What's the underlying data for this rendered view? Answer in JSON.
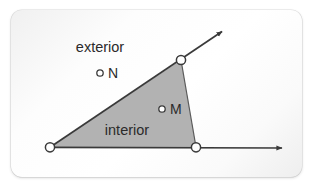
{
  "figure": {
    "type": "geometry-diagram",
    "canvas": {
      "width": 315,
      "height": 188
    },
    "card": {
      "x": 11,
      "y": 10,
      "width": 291,
      "height": 167,
      "corner_radius": 11,
      "background_color": "#fbfbfb",
      "shadow_color": "rgba(0,0,0,0.16)"
    },
    "colors": {
      "stroke": "#3a3a3a",
      "interior_fill": "#b2b2b2",
      "vertex_fill": "#ffffff",
      "text": "#2b2b2b"
    },
    "geometry": {
      "vertex": {
        "name": "angle-vertex",
        "x": 50,
        "y": 147,
        "radius": 4.6
      },
      "ray_horizontal": {
        "name": "ray-horizontal",
        "from": {
          "x": 50,
          "y": 147
        },
        "to": {
          "x": 285,
          "y": 148
        },
        "arrow": true
      },
      "ray_diagonal": {
        "name": "ray-diagonal",
        "from": {
          "x": 50,
          "y": 147
        },
        "to": {
          "x": 224,
          "y": 30
        },
        "arrow": true
      },
      "point_on_horizontal": {
        "name": "point-on-horizontal-ray",
        "x": 196,
        "y": 147,
        "radius": 4.6
      },
      "point_on_diagonal": {
        "name": "point-on-diagonal-ray",
        "x": 181,
        "y": 60,
        "radius": 4.6
      },
      "interior_region": {
        "name": "interior-region",
        "polygon": [
          {
            "x": 50,
            "y": 147
          },
          {
            "x": 181,
            "y": 60
          },
          {
            "x": 196,
            "y": 147
          }
        ]
      }
    },
    "labels": {
      "exterior": {
        "text": "exterior",
        "x": 100,
        "y": 47,
        "anchor": "middle"
      },
      "interior": {
        "text": "interior",
        "x": 127,
        "y": 130,
        "anchor": "middle"
      }
    },
    "points": [
      {
        "id": "N",
        "label": "N",
        "marker": {
          "x": 100,
          "y": 73,
          "radius": 3.2,
          "filled": false
        },
        "label_pos": {
          "x": 107,
          "y": 78
        },
        "region": "exterior"
      },
      {
        "id": "M",
        "label": "M",
        "marker": {
          "x": 162,
          "y": 109,
          "radius": 3.2,
          "filled": false
        },
        "label_pos": {
          "x": 169,
          "y": 115
        },
        "region": "interior"
      }
    ]
  }
}
